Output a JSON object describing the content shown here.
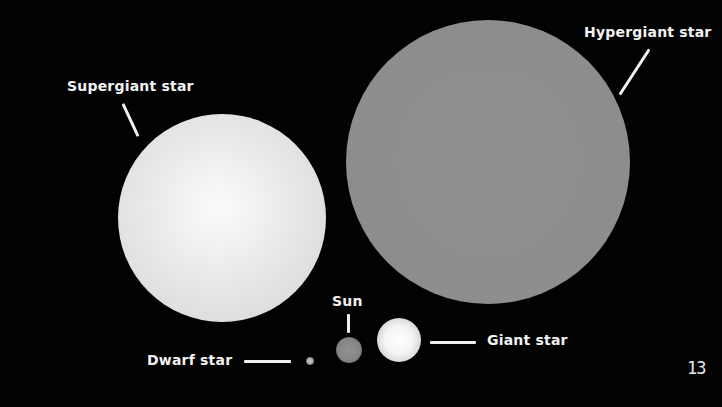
{
  "diagram": {
    "background": "#000000",
    "stars": [
      {
        "id": "hypergiant",
        "label": "Hypergiant star",
        "color": "#8e8e8e"
      },
      {
        "id": "supergiant",
        "label": "Supergiant star",
        "color": "#e6e6e6"
      },
      {
        "id": "giant",
        "label": "Giant star",
        "color": "#f0f0f0"
      },
      {
        "id": "sun",
        "label": "Sun",
        "color": "#8a8a8a"
      },
      {
        "id": "dwarf",
        "label": "Dwarf star",
        "color": "#bdbdbd"
      }
    ],
    "page_number": "13"
  }
}
